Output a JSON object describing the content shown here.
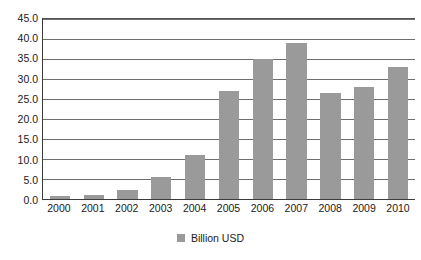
{
  "chart_data": {
    "type": "bar",
    "title": "",
    "subtitle": "",
    "xlabel": "",
    "ylabel": "",
    "categories": [
      "2000",
      "2001",
      "2002",
      "2003",
      "2004",
      "2005",
      "2006",
      "2007",
      "2008",
      "2009",
      "2010"
    ],
    "values": [
      0.8,
      1.1,
      2.2,
      5.5,
      11.0,
      27.0,
      35.0,
      39.0,
      26.5,
      28.0,
      33.0
    ],
    "series": [
      {
        "name": "Billion USD",
        "color": "#9a9a9a",
        "values": [
          0.8,
          1.1,
          2.2,
          5.5,
          11.0,
          27.0,
          35.0,
          39.0,
          26.5,
          28.0,
          33.0
        ]
      }
    ],
    "ylim": [
      0.0,
      45.0
    ],
    "ytick_step": 5.0,
    "ytick_labels": [
      "45.0",
      "40.0",
      "35.0",
      "30.0",
      "25.0",
      "20.0",
      "15.0",
      "10.0",
      "5.0",
      "0.0"
    ],
    "ytick_values": [
      45.0,
      40.0,
      35.0,
      30.0,
      25.0,
      20.0,
      15.0,
      10.0,
      5.0,
      0.0
    ],
    "grid": true,
    "grid_axis": "y",
    "legend": {
      "position": "bottom",
      "entries": [
        {
          "label": "Billion USD",
          "swatch_name": "legend-swatch-billion-usd",
          "color": "#9a9a9a"
        }
      ]
    },
    "colors": {
      "bar_fill": "#9a9a9a",
      "gridline": "#6e6e6e",
      "axis_line": "#3c3c3c",
      "text": "#1a1a1a",
      "background": "#ffffff"
    }
  }
}
